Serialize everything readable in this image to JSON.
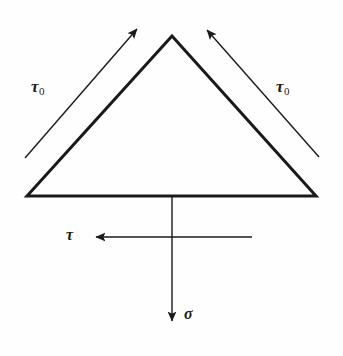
{
  "figure": {
    "background_color": "#fefefe",
    "stroke_color": "#1a1a1a",
    "labels": {
      "tau_zero_left": {
        "symbol": "τ",
        "subscript": "0"
      },
      "tau_zero_right": {
        "symbol": "τ",
        "subscript": "0"
      },
      "tau": {
        "symbol": "τ",
        "subscript": ""
      },
      "sigma": {
        "symbol": "σ",
        "subscript": ""
      }
    },
    "shapes": {
      "triangle": {
        "name": "wedge-triangle",
        "apex": [
          172,
          36
        ],
        "bottom_left": [
          27,
          196
        ],
        "bottom_right": [
          316,
          196
        ],
        "stroke_width": 3
      },
      "arrow_tau0_left": {
        "name": "tau0-left-arrow",
        "from": [
          25,
          158
        ],
        "to": [
          139,
          27
        ],
        "direction": "up-right",
        "stroke_width": 1.4
      },
      "arrow_tau0_right": {
        "name": "tau0-right-arrow",
        "from": [
          319,
          157
        ],
        "to": [
          205,
          28
        ],
        "direction": "up-left",
        "stroke_width": 1.4
      },
      "arrow_tau": {
        "name": "tau-horizontal-arrow",
        "from": [
          252,
          237
        ],
        "to": [
          94,
          237
        ],
        "direction": "left",
        "stroke_width": 1.4
      },
      "arrow_sigma": {
        "name": "sigma-vertical-arrow",
        "from": [
          172,
          196
        ],
        "to": [
          172,
          323
        ],
        "direction": "down",
        "stroke_width": 1.4
      }
    }
  }
}
